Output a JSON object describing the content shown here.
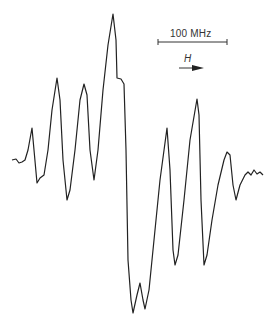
{
  "figure": {
    "type": "EPR/ESR spectrum trace (first-derivative hyperfine lines)",
    "scale_bar": {
      "label": "100 MHz",
      "x1": 158,
      "x2": 227,
      "y": 42
    },
    "field_arrow": {
      "label": "H",
      "direction": "right"
    },
    "trace_color": "#222222"
  },
  "chart_data": {
    "type": "line",
    "title": "",
    "xlabel": "Magnetic field H",
    "ylabel": "",
    "grid": false,
    "annotations": [
      "100 MHz",
      "H"
    ],
    "series": [
      {
        "name": "spectrum",
        "points_px": [
          [
            12,
            160
          ],
          [
            16,
            159
          ],
          [
            19,
            163
          ],
          [
            22,
            162
          ],
          [
            25,
            160
          ],
          [
            28,
            150
          ],
          [
            32,
            128
          ],
          [
            34,
            150
          ],
          [
            37,
            183
          ],
          [
            40,
            178
          ],
          [
            44,
            175
          ],
          [
            48,
            150
          ],
          [
            52,
            110
          ],
          [
            57,
            78
          ],
          [
            60,
            100
          ],
          [
            63,
            160
          ],
          [
            67,
            200
          ],
          [
            70,
            190
          ],
          [
            75,
            150
          ],
          [
            80,
            100
          ],
          [
            84,
            84
          ],
          [
            87,
            95
          ],
          [
            90,
            150
          ],
          [
            94,
            180
          ],
          [
            98,
            150
          ],
          [
            103,
            90
          ],
          [
            108,
            45
          ],
          [
            113,
            14
          ],
          [
            116,
            40
          ],
          [
            117,
            78
          ],
          [
            121,
            79
          ],
          [
            124,
            84
          ],
          [
            126,
            150
          ],
          [
            128,
            260
          ],
          [
            131,
            300
          ],
          [
            133,
            313
          ],
          [
            137,
            295
          ],
          [
            140,
            283
          ],
          [
            143,
            300
          ],
          [
            145,
            309
          ],
          [
            149,
            290
          ],
          [
            154,
            240
          ],
          [
            160,
            180
          ],
          [
            167,
            128
          ],
          [
            170,
            170
          ],
          [
            173,
            250
          ],
          [
            175,
            265
          ],
          [
            178,
            255
          ],
          [
            184,
            200
          ],
          [
            190,
            140
          ],
          [
            197,
            99
          ],
          [
            199,
            115
          ],
          [
            201,
            200
          ],
          [
            204,
            265
          ],
          [
            207,
            255
          ],
          [
            212,
            220
          ],
          [
            218,
            185
          ],
          [
            224,
            160
          ],
          [
            227,
            152
          ],
          [
            230,
            155
          ],
          [
            233,
            185
          ],
          [
            236,
            200
          ],
          [
            240,
            185
          ],
          [
            245,
            175
          ],
          [
            248,
            172
          ],
          [
            251,
            175
          ],
          [
            254,
            170
          ],
          [
            257,
            174
          ],
          [
            260,
            172
          ],
          [
            263,
            175
          ]
        ]
      }
    ]
  }
}
